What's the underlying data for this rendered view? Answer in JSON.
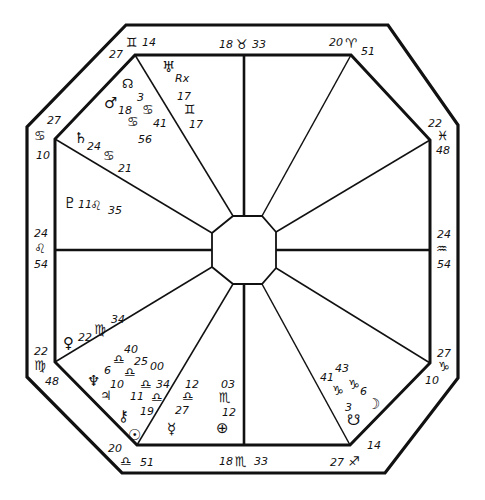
{
  "colors": {
    "ink": "#111111",
    "paper": "#ffffff"
  },
  "house_cusps": [
    {
      "id": "cusp-mc",
      "degree": "18",
      "sign": "♉",
      "sign_name": "taurus",
      "minutes": "33"
    },
    {
      "id": "cusp-11",
      "degree": "20",
      "sign": "♈",
      "sign_name": "aries",
      "minutes": "51"
    },
    {
      "id": "cusp-12",
      "degree": "22",
      "sign": "♓",
      "sign_name": "pisces",
      "minutes": "48"
    },
    {
      "id": "cusp-asc",
      "degree": "24",
      "sign": "♒",
      "sign_name": "aquarius",
      "minutes": "54"
    },
    {
      "id": "cusp-2",
      "degree": "27",
      "sign": "♑",
      "sign_name": "capricorn",
      "minutes": "10"
    },
    {
      "id": "cusp-3",
      "degree": "27",
      "sign": "♐",
      "sign_name": "sagittarius",
      "minutes": "14"
    },
    {
      "id": "cusp-ic",
      "degree": "18",
      "sign": "♏",
      "sign_name": "scorpio",
      "minutes": "33"
    },
    {
      "id": "cusp-5",
      "degree": "20",
      "sign": "♎",
      "sign_name": "libra",
      "minutes": "51"
    },
    {
      "id": "cusp-6",
      "degree": "22",
      "sign": "♍",
      "sign_name": "virgo",
      "minutes": "48"
    },
    {
      "id": "cusp-dsc",
      "degree": "24",
      "sign": "♌",
      "sign_name": "leo",
      "minutes": "54"
    },
    {
      "id": "cusp-8",
      "degree": "27",
      "sign": "♋",
      "sign_name": "cancer",
      "minutes": "10"
    },
    {
      "id": "cusp-9",
      "degree": "27",
      "sign": "♊",
      "sign_name": "gemini",
      "minutes": "14"
    }
  ],
  "planets": {
    "uranus": {
      "glyph": "♅",
      "retro": "Rx",
      "degree": "17",
      "sign": "♊",
      "minutes": "17"
    },
    "north_node": {
      "glyph": "☊",
      "degree": "3",
      "sign": "♋",
      "minutes": "41"
    },
    "mars": {
      "glyph": "♂",
      "degree": "18",
      "sign": "♋",
      "minutes": "56"
    },
    "saturn": {
      "glyph": "♄",
      "degree": "24",
      "sign": "♋",
      "minutes": "21"
    },
    "pluto": {
      "glyph": "♇",
      "degree": "11",
      "sign": "♌",
      "minutes": "35"
    },
    "venus": {
      "glyph": "♀",
      "degree": "22",
      "sign": "♍",
      "minutes": "34"
    },
    "neptune": {
      "glyph": "♆",
      "degree": "6",
      "sign": "♎",
      "minutes": "40"
    },
    "jupiter": {
      "glyph": "♃",
      "degree": "10",
      "sign": "♎",
      "minutes": "25"
    },
    "chiron": {
      "glyph": "⚷",
      "degree": "11",
      "sign": "♎",
      "minutes": "00"
    },
    "sun": {
      "glyph": "☉",
      "degree": "19",
      "sign": "♎",
      "minutes": "34"
    },
    "mercury": {
      "glyph": "☿",
      "degree": "12",
      "sign": "♎",
      "minutes": "27"
    },
    "part_of_fortune": {
      "glyph": "⊕",
      "degree": "03",
      "sign": "♏",
      "minutes": "12"
    },
    "south_node": {
      "glyph": "☋",
      "degree": "3",
      "sign": "♑",
      "minutes": "41"
    },
    "moon": {
      "glyph": "☽",
      "degree": "6",
      "sign": "♑",
      "minutes": "43"
    }
  }
}
